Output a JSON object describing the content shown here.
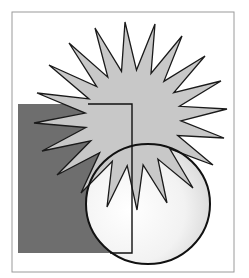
{
  "illustration": {
    "title": "Starburst, rectangle and circle clip-art",
    "frame": {
      "x": 12,
      "y": 12,
      "width": 222,
      "height": 260,
      "stroke": "#9a9a9a"
    },
    "rectangle": {
      "x": 18,
      "y": 104,
      "width": 114,
      "height": 149,
      "fill": "#6e6e6e"
    },
    "starburst": {
      "fill": "#c8c8c8",
      "stroke": "#1a1a1a",
      "center": [
        133,
        118
      ],
      "tips": [
        [
          95,
          28
        ],
        [
          125,
          22
        ],
        [
          155,
          24
        ],
        [
          182,
          36
        ],
        [
          205,
          56
        ],
        [
          221,
          81
        ],
        [
          227,
          109
        ],
        [
          224,
          138
        ],
        [
          213,
          165
        ],
        [
          193,
          188
        ],
        [
          167,
          203
        ],
        [
          137,
          210
        ],
        [
          107,
          207
        ],
        [
          81,
          193
        ],
        [
          57,
          175
        ],
        [
          42,
          151
        ],
        [
          34,
          123
        ],
        [
          37,
          93
        ],
        [
          49,
          65
        ],
        [
          69,
          43
        ]
      ],
      "inner_radius": 48
    },
    "circle": {
      "cx": 148,
      "cy": 204,
      "rx": 62,
      "ry": 60,
      "fill_light": "#ffffff",
      "fill_dark": "#d6d6d6",
      "stroke": "#111111"
    },
    "rectangle_outline": {
      "x1": 132,
      "top": 104,
      "bottom": 253,
      "left_top": 88,
      "stroke": "#111111"
    }
  }
}
